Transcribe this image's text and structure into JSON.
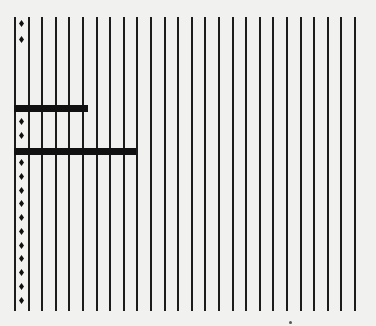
{
  "figure": {
    "background": "#f1f1f0",
    "ink": "#1c1c1c",
    "grid": {
      "count": 26,
      "x_start": 14,
      "spacing": 13.6,
      "y_top": 17,
      "y_bottom": 311
    },
    "bars": [
      {
        "x": 14,
        "y": 105,
        "width": 74
      },
      {
        "x": 14,
        "y": 148,
        "width": 122
      }
    ],
    "markers": {
      "x": 19,
      "y": [
        20,
        36,
        118,
        132,
        159,
        173,
        187,
        200,
        214,
        228,
        242,
        255,
        269,
        283,
        297
      ]
    }
  }
}
